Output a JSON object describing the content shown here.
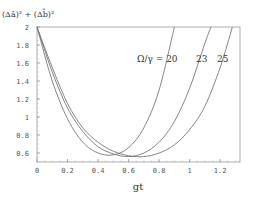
{
  "chart_data": {
    "type": "line",
    "title": "",
    "ylabel": "(Δâ)² + (Δb̂)²",
    "xlabel": "gt",
    "xlim": [
      0,
      1.33
    ],
    "ylim": [
      0.5,
      2
    ],
    "xticks": [
      "0",
      "0.2",
      "0.4",
      "0.6",
      "0.8",
      "1",
      "1.2"
    ],
    "yticks": [
      "0.6",
      "0.8",
      "1",
      "1.2",
      "1.4",
      "1.6",
      "1.8",
      "2"
    ],
    "grid": false,
    "legend": "inline annotations",
    "annotations": [
      "Ω/γ = 20",
      "23",
      "25"
    ],
    "series": [
      {
        "name": "Ω/γ = 20",
        "x": [
          0,
          0.1,
          0.2,
          0.3,
          0.4,
          0.5,
          0.6,
          0.7,
          0.8,
          0.9
        ],
        "values": [
          2.0,
          1.4,
          0.98,
          0.72,
          0.6,
          0.58,
          0.66,
          0.88,
          1.3,
          2.0
        ]
      },
      {
        "name": "Ω/γ = 23",
        "x": [
          0,
          0.1,
          0.2,
          0.3,
          0.4,
          0.5,
          0.6,
          0.7,
          0.8,
          0.9,
          1.0,
          1.1,
          1.14
        ],
        "values": [
          2.0,
          1.5,
          1.1,
          0.84,
          0.67,
          0.59,
          0.56,
          0.6,
          0.72,
          0.95,
          1.32,
          1.82,
          2.0
        ]
      },
      {
        "name": "Ω/γ = 25",
        "x": [
          0,
          0.1,
          0.2,
          0.3,
          0.4,
          0.5,
          0.6,
          0.7,
          0.8,
          0.9,
          1.0,
          1.1,
          1.2,
          1.28
        ],
        "values": [
          2.0,
          1.55,
          1.15,
          0.88,
          0.72,
          0.62,
          0.57,
          0.56,
          0.6,
          0.69,
          0.86,
          1.12,
          1.55,
          2.0
        ]
      }
    ]
  }
}
